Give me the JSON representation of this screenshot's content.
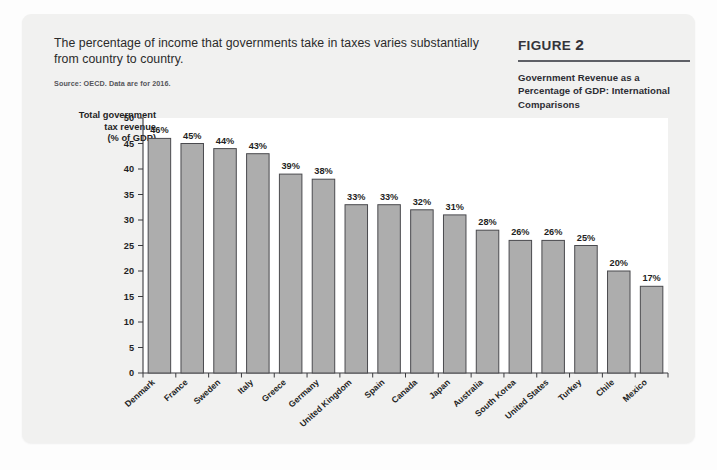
{
  "caption": {
    "text": "The percentage of income that governments take in taxes varies substantially from country to country.",
    "source": "Source: OECD. Data are for 2016."
  },
  "figure": {
    "label_word": "FIGURE",
    "number": "2",
    "subtitle": "Government Revenue as a Percentage of GDP: International Comparisons"
  },
  "axis": {
    "y_title": "Total government tax revenue (% of GDP)",
    "y_title_line1": "Total government",
    "y_title_line2": "tax revenue",
    "y_title_line3": "(% of GDP)"
  },
  "chart_data": {
    "type": "bar",
    "title": "Government Revenue as a Percentage of GDP: International Comparisons",
    "xlabel": "",
    "ylabel": "Total government tax revenue (% of GDP)",
    "ylim": [
      0,
      50
    ],
    "yticks": [
      0,
      5,
      10,
      15,
      20,
      25,
      30,
      35,
      40,
      45,
      50
    ],
    "ytick_labels": [
      "0",
      "5",
      "10",
      "15",
      "20",
      "25",
      "30",
      "35",
      "40",
      "45",
      "50"
    ],
    "grid": false,
    "legend": null,
    "bar_color": "#adadad",
    "bar_edge_color": "#4a4a4e",
    "categories": [
      "Denmark",
      "France",
      "Sweden",
      "Italy",
      "Greece",
      "Germany",
      "United Kingdom",
      "Spain",
      "Canada",
      "Japan",
      "Australia",
      "South Korea",
      "United States",
      "Turkey",
      "Chile",
      "Mexico"
    ],
    "values": [
      46,
      45,
      44,
      43,
      39,
      38,
      33,
      33,
      32,
      31,
      28,
      26,
      26,
      25,
      20,
      17
    ],
    "data_labels": [
      "46%",
      "45%",
      "44%",
      "43%",
      "39%",
      "38%",
      "33%",
      "33%",
      "32%",
      "31%",
      "28%",
      "26%",
      "26%",
      "25%",
      "20%",
      "17%"
    ]
  }
}
